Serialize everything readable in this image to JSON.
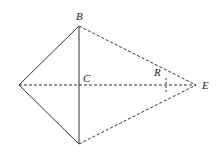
{
  "diagram": {
    "labels": {
      "B": "B",
      "C": "C",
      "R": "R",
      "E": "E"
    },
    "colors": {
      "stroke": "#333333",
      "background": "#ffffff"
    },
    "points": {
      "A": [
        19,
        85
      ],
      "B": [
        79,
        26
      ],
      "C": [
        79,
        85
      ],
      "D": [
        79,
        144
      ],
      "E": [
        196,
        85
      ]
    }
  }
}
